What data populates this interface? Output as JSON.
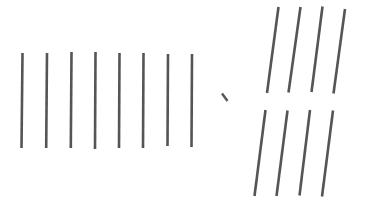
{
  "canvas": {
    "width": 365,
    "height": 207,
    "background_color": "#ffffff",
    "title": "Hand-drawn line strokes figure"
  },
  "style": {
    "stroke_color": "#555555",
    "stroke_color_dark": "#4a4a4a",
    "stroke_width": 2.6,
    "stroke_width_thin": 2.4
  },
  "groups": [
    {
      "id": "left-vertical-group",
      "label": "Vertical strokes group",
      "orientation": "vertical",
      "count": 8,
      "strokes": [
        {
          "x1": 22.5,
          "y1": 53,
          "x2": 21.5,
          "y2": 148
        },
        {
          "x1": 47.0,
          "y1": 53,
          "x2": 46.2,
          "y2": 148
        },
        {
          "x1": 71.5,
          "y1": 52,
          "x2": 70.8,
          "y2": 148
        },
        {
          "x1": 95.5,
          "y1": 52,
          "x2": 95.0,
          "y2": 149
        },
        {
          "x1": 119.5,
          "y1": 53,
          "x2": 119.0,
          "y2": 148
        },
        {
          "x1": 143.5,
          "y1": 53,
          "x2": 143.0,
          "y2": 148
        },
        {
          "x1": 168.0,
          "y1": 54,
          "x2": 167.5,
          "y2": 146
        },
        {
          "x1": 192.0,
          "y1": 54,
          "x2": 191.5,
          "y2": 147
        }
      ]
    },
    {
      "id": "center-tick-mark",
      "label": "Small diagonal tick mark",
      "orientation": "diagonal",
      "count": 1,
      "strokes": [
        {
          "x1": 222.0,
          "y1": 93.5,
          "x2": 227.5,
          "y2": 101.0
        }
      ]
    },
    {
      "id": "upper-right-slanted-group",
      "label": "Upper slanted strokes group",
      "orientation": "slanted",
      "count": 4,
      "strokes": [
        {
          "x1": 278.5,
          "y1": 7.0,
          "x2": 267.0,
          "y2": 93.0
        },
        {
          "x1": 300.5,
          "y1": 7.0,
          "x2": 288.5,
          "y2": 92.5
        },
        {
          "x1": 322.5,
          "y1": 6.5,
          "x2": 311.5,
          "y2": 92.0
        },
        {
          "x1": 345.0,
          "y1": 9.0,
          "x2": 333.5,
          "y2": 93.5
        }
      ]
    },
    {
      "id": "lower-right-slanted-group",
      "label": "Lower slanted strokes group",
      "orientation": "slanted",
      "count": 4,
      "strokes": [
        {
          "x1": 265.5,
          "y1": 110.0,
          "x2": 254.5,
          "y2": 196.0
        },
        {
          "x1": 287.5,
          "y1": 110.5,
          "x2": 276.5,
          "y2": 196.0
        },
        {
          "x1": 310.0,
          "y1": 110.0,
          "x2": 299.5,
          "y2": 195.5
        },
        {
          "x1": 333.0,
          "y1": 110.5,
          "x2": 322.0,
          "y2": 196.5
        }
      ]
    }
  ]
}
